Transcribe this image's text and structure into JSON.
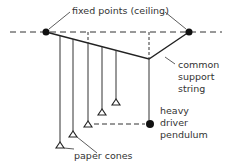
{
  "diagram": {
    "labels": {
      "fixed_points": "fixed points (ceiling)",
      "support_string": [
        "common",
        "support",
        "string"
      ],
      "driver": [
        "heavy",
        "driver",
        "pendulum"
      ],
      "cones": "paper cones"
    },
    "colors": {
      "line": "#222222",
      "text": "#333333"
    }
  }
}
